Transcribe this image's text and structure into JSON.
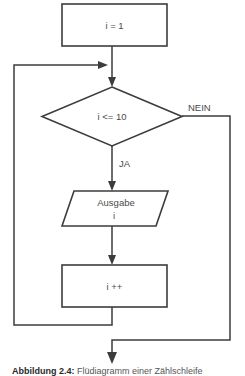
{
  "figure": {
    "type": "flowchart",
    "language": "de",
    "background_color": "#ffffff",
    "stroke_color": "#3c3c3c",
    "text_color": "#4a4a4a",
    "width": 245,
    "height": 376
  },
  "nodes": {
    "init": {
      "shape": "rectangle",
      "label": "i = 1",
      "role": "process"
    },
    "condition": {
      "shape": "diamond",
      "label": "i <= 10",
      "role": "decision"
    },
    "output": {
      "shape": "parallelogram",
      "label_line1": "Ausgabe",
      "label_line2": "i",
      "role": "input-output"
    },
    "increment": {
      "shape": "rectangle",
      "label": "i ++",
      "role": "process"
    }
  },
  "edges": {
    "no_label": "NEIN",
    "yes_label": "JA"
  },
  "caption": {
    "prefix": "Abbildung 2.4:",
    "text": "Flüdiagramm einer Zählschleife"
  }
}
